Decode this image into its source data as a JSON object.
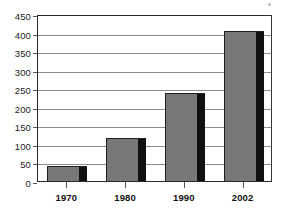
{
  "chart_data": {
    "type": "bar",
    "title": "",
    "subtitle": "",
    "xlabel": "",
    "ylabel": "",
    "categories": [
      "1970",
      "1980",
      "1990",
      "2002"
    ],
    "values": [
      41,
      117,
      237,
      405
    ],
    "series": [
      {
        "name": "",
        "values": [
          41,
          117,
          237,
          405
        ]
      }
    ],
    "ylim": [
      0,
      450
    ],
    "ytick_step": 50,
    "ytick_labels": [
      "0",
      "50",
      "100",
      "150",
      "200",
      "250",
      "300",
      "350",
      "400",
      "450"
    ],
    "ytick_values": [
      0,
      50,
      100,
      150,
      200,
      250,
      300,
      350,
      400,
      450
    ],
    "xtick_labels": [
      "1970",
      "1980",
      "1990",
      "2002"
    ],
    "grid": true,
    "grid_orientation": "horizontal",
    "legend": false,
    "legend_position": "none",
    "annotations": [],
    "colors": {
      "bar_fill": "#787878",
      "bar_shadow": "#101010",
      "bar_outline": "#1f1f1f",
      "gridline": "#8d8d8d",
      "axis": "#2b2b2b",
      "background": "#ffffff",
      "text": "#111111"
    }
  }
}
